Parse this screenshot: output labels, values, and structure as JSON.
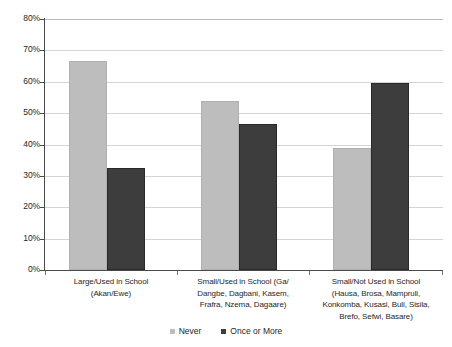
{
  "chart_data": {
    "type": "bar",
    "title": "",
    "xlabel": "",
    "ylabel": "",
    "ylim": [
      0,
      80
    ],
    "ytick_labels": [
      "80%",
      "70%",
      "60%",
      "50%",
      "40%",
      "30%",
      "20%",
      "10%",
      "0%"
    ],
    "ytick_values": [
      80,
      70,
      60,
      50,
      40,
      30,
      20,
      10,
      0
    ],
    "grid": true,
    "legend_position": "bottom-center",
    "categories": [
      "Large/Used in School (Akan/Ewe)",
      "Small/Used in School (Ga/Dangbe, Dagbani, Kasem, Frafra, Nzema, Dagaare)",
      "Small/Not Used in School (Hausa, Brosa, Mampruli, Konkomba, Kusasi, Buli, Sisila, Brefo, Sefwi, Basare)"
    ],
    "category_lines": [
      [
        "Large/Used in School",
        "(Akan/Ewe)"
      ],
      [
        "Small/Used in School (Ga/",
        "Dangbe, Dagbani, Kasem,",
        "Frafra, Nzema, Dagaare)"
      ],
      [
        "Small/Not Used in School",
        "(Hausa, Brosa, Mampruli,",
        "Konkomba, Kusasi, Buli, Sisila,",
        "Brefo, Sefwi, Basare)"
      ]
    ],
    "series": [
      {
        "name": "Never",
        "color": "#bdbdbd",
        "values": [
          66.5,
          54.0,
          39.0
        ]
      },
      {
        "name": "Once or More",
        "color": "#3d3d3d",
        "values": [
          32.5,
          46.5,
          59.5
        ]
      }
    ]
  },
  "legend": {
    "items": [
      {
        "label": "Never",
        "color": "#bdbdbd"
      },
      {
        "label": "Once or More",
        "color": "#3d3d3d"
      }
    ]
  }
}
